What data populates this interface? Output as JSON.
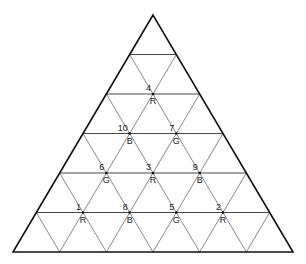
{
  "diagram": {
    "type": "triangular-grid",
    "rows": 6,
    "apex": [
      153,
      15
    ],
    "base_left": [
      13,
      252
    ],
    "base_right": [
      293,
      252
    ],
    "colors": {
      "outer": "#111111",
      "horizontal": "#333333",
      "diagonal": "#555555",
      "dot": "#111111"
    },
    "color_key": {
      "R": "red",
      "G": "green",
      "B": "blue"
    },
    "vertices": [
      {
        "row": 2,
        "k": 1,
        "number": "4",
        "color": "R"
      },
      {
        "row": 3,
        "k": 1,
        "number": "10",
        "color": "B"
      },
      {
        "row": 3,
        "k": 2,
        "number": "7",
        "color": "G"
      },
      {
        "row": 4,
        "k": 1,
        "number": "6",
        "color": "G"
      },
      {
        "row": 4,
        "k": 2,
        "number": "3",
        "color": "R"
      },
      {
        "row": 4,
        "k": 3,
        "number": "9",
        "color": "B"
      },
      {
        "row": 5,
        "k": 1,
        "number": "1",
        "color": "R"
      },
      {
        "row": 5,
        "k": 2,
        "number": "8",
        "color": "B"
      },
      {
        "row": 5,
        "k": 3,
        "number": "5",
        "color": "G"
      },
      {
        "row": 5,
        "k": 4,
        "number": "2",
        "color": "R"
      }
    ]
  }
}
